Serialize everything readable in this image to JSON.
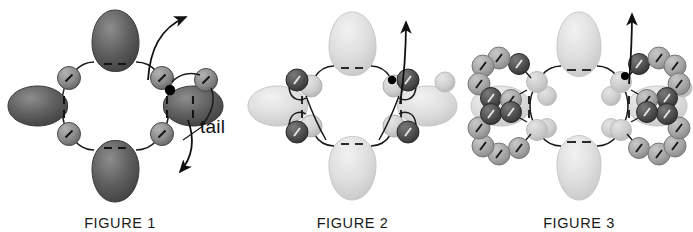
{
  "page": {
    "background_color": "#ffffff",
    "width": 693,
    "height": 232,
    "kind": "scientific-illustration-series"
  },
  "palette": {
    "lobe_dark": "#5a5a5a",
    "lobe_dark_edge": "#3a3a3a",
    "lobe_light": "#dcdcdc",
    "lobe_light_edge": "#c4c4c4",
    "sphere_mid": "#a8a8a8",
    "sphere_mid_edge": "#6f6f6f",
    "sphere_dark": "#4f4f4f",
    "sphere_dark_edge": "#2e2e2e",
    "sphere_pale": "#cfcfcf",
    "sphere_pale_edge": "#b4b4b4",
    "line_color": "#1a1a1a",
    "text_color": "#1a1a1a",
    "node_dot": "#000000"
  },
  "figures": [
    {
      "id": "figure-1",
      "caption": "FIGURE 1",
      "lobe_fill": "#5a5a5a",
      "lobe_stroke": "#3a3a3a",
      "sphere_fill": "#8f8f8f",
      "sphere_stroke": "#5a5a5a",
      "lobe_count": 4,
      "ring_sphere_count": 4,
      "outer_sphere_count": 1,
      "has_tail_annotation": true,
      "has_up_arrow": true,
      "has_down_arrow": true,
      "node_dot_visible": true,
      "annotation": {
        "label": "tail",
        "leader_line": true
      }
    },
    {
      "id": "figure-2",
      "caption": "FIGURE 2",
      "lobe_fill": "#dcdcdc",
      "lobe_stroke": "#c4c4c4",
      "sphere_fill": "#cfcfcf",
      "sphere_stroke": "#b4b4b4",
      "dark_sphere_fill": "#4f4f4f",
      "dark_sphere_stroke": "#2e2e2e",
      "lobe_count": 4,
      "ring_sphere_count": 4,
      "dark_sphere_count": 4,
      "outer_sphere_count": 2,
      "has_tail_annotation": false,
      "has_up_arrow": true,
      "has_down_arrow": false,
      "node_dot_visible": true
    },
    {
      "id": "figure-3",
      "caption": "FIGURE 3",
      "lobe_fill": "#dcdcdc",
      "lobe_stroke": "#c4c4c4",
      "sphere_fill": "#a8a8a8",
      "sphere_stroke": "#6f6f6f",
      "dark_sphere_fill": "#4f4f4f",
      "dark_sphere_stroke": "#2e2e2e",
      "pale_sphere_fill": "#cfcfcf",
      "lobe_count": 4,
      "ring_sphere_count": 4,
      "arc_cluster_count": 4,
      "spheres_per_arc": 6,
      "pale_inner_sphere_count": 4,
      "has_tail_annotation": false,
      "has_up_arrow": true,
      "has_down_arrow": false,
      "node_dot_visible": true
    }
  ]
}
